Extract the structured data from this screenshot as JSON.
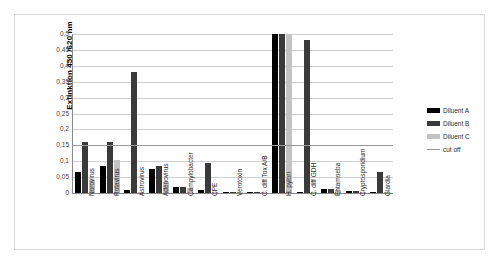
{
  "chart_data": {
    "type": "bar",
    "title": "",
    "xlabel": "",
    "ylabel": "Extinktion 450 /620 nm",
    "ylim": [
      0,
      0.5
    ],
    "ytick_labels": [
      "0,5",
      "0,45",
      "0,4",
      "0,35",
      "0,3",
      "0,25",
      "0,2",
      "0,15",
      "0,1",
      "0,05",
      "0"
    ],
    "ytick_values": [
      0.5,
      0.45,
      0.4,
      0.35,
      0.3,
      0.25,
      0.2,
      0.15,
      0.1,
      0.05,
      0
    ],
    "grid": true,
    "legend_position": "right",
    "categories": [
      "Norovirus",
      "Rotavirus",
      "Astrovirus",
      "Adenovirus",
      "Campylobacter",
      "CPE",
      "Verotoxin",
      "C. diff Tox A/B",
      "H. pylori",
      "C. diff GDH",
      "Entamoeba",
      "Cryptosporidium",
      "Giardia"
    ],
    "series": [
      {
        "name": "Diluent A",
        "color": "#000000",
        "values": [
          0.065,
          0.085,
          0.01,
          0.075,
          0.02,
          0.008,
          0.002,
          0.003,
          0.5,
          0.003,
          0.012,
          0.005,
          0.002
        ]
      },
      {
        "name": "Diluent B",
        "color": "#3a3a3a",
        "values": [
          0.16,
          0.16,
          0.38,
          0.085,
          0.02,
          0.095,
          0.002,
          0.004,
          0.5,
          0.48,
          0.013,
          0.006,
          0.065
        ]
      },
      {
        "name": "Diluent C",
        "color": "#c2c2c2",
        "values": [
          0.04,
          0.105,
          0.002,
          0.035,
          0.015,
          0.004,
          0.001,
          0.002,
          0.5,
          0.002,
          0.008,
          0.004,
          0.002
        ]
      }
    ],
    "cut_off": {
      "name": "cut off",
      "color": "#9a9a9a",
      "value": 0.15
    }
  },
  "legend": {
    "entries": [
      {
        "label": "Diluent A",
        "type": "swatch-a"
      },
      {
        "label": "Diluent B",
        "type": "swatch-b"
      },
      {
        "label": "Diluent C",
        "type": "swatch-c"
      },
      {
        "label": "cut off",
        "type": "line"
      }
    ]
  }
}
